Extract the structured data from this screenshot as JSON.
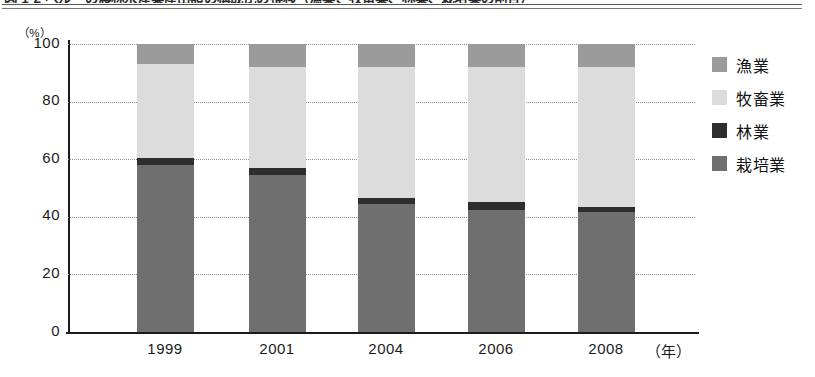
{
  "figure": {
    "title": "図 1-2 ペルーの農林水産業産出額の構成比の推移（漁業、牧畜業、林業、栽培業の割合）",
    "title_cropped": true
  },
  "axes": {
    "y_unit": "（%）",
    "y_ticks": [
      "100",
      "80",
      "60",
      "40",
      "20",
      "0"
    ],
    "x_unit": "（年）"
  },
  "legend": {
    "items": [
      {
        "label": "漁業",
        "color": "#9b9b9b"
      },
      {
        "label": "牧畜業",
        "color": "#dcdcdc"
      },
      {
        "label": "林業",
        "color": "#2e2e2e"
      },
      {
        "label": "栽培業",
        "color": "#6f6f6f"
      }
    ]
  },
  "chart_data": {
    "type": "bar",
    "stacked": true,
    "stacked_100pct": true,
    "title": "図 1-2 ペルーの農林水産業産出額の構成比の推移",
    "xlabel": "（年）",
    "ylabel": "（%）",
    "ylim": [
      0,
      100
    ],
    "yticks": [
      0,
      20,
      40,
      60,
      80,
      100
    ],
    "grid": "horizontal-dotted",
    "legend_position": "right",
    "categories": [
      "1999",
      "2001",
      "2004",
      "2006",
      "2008"
    ],
    "series": [
      {
        "name": "栽培業",
        "color": "#6f6f6f",
        "values": [
          58.0,
          54.5,
          44.5,
          42.5,
          41.5
        ]
      },
      {
        "name": "林業",
        "color": "#2e2e2e",
        "values": [
          2.5,
          2.5,
          2.0,
          2.5,
          2.0
        ]
      },
      {
        "name": "牧畜業",
        "color": "#dcdcdc",
        "values": [
          32.5,
          35.0,
          45.5,
          47.0,
          48.5
        ]
      },
      {
        "name": "漁業",
        "color": "#9b9b9b",
        "values": [
          7.0,
          8.0,
          8.0,
          8.0,
          8.0
        ]
      }
    ],
    "stack_order_bottom_to_top": [
      "栽培業",
      "林業",
      "牧畜業",
      "漁業"
    ]
  }
}
